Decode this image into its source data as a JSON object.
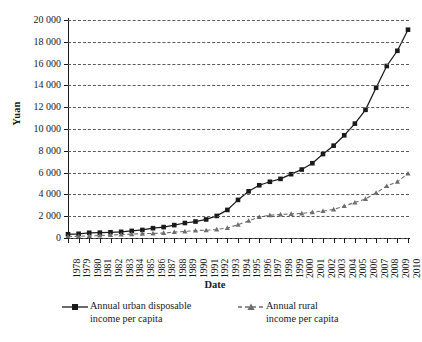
{
  "chart_data": {
    "type": "line",
    "title": "",
    "xlabel": "Date",
    "ylabel": "Yuan",
    "ylim": [
      0,
      20000
    ],
    "ytick_step": 2000,
    "ytick_labels": [
      "0",
      "2 000",
      "4 000",
      "6 000",
      "8 000",
      "10 000",
      "12 000",
      "14 000",
      "16 000",
      "18 000",
      "20 000"
    ],
    "ytick_values": [
      0,
      2000,
      4000,
      6000,
      8000,
      10000,
      12000,
      14000,
      16000,
      18000,
      20000
    ],
    "grid": true,
    "grid_style": "dashed-horizontal",
    "legend_position": "bottom",
    "categories": [
      "1978",
      "1979",
      "1980",
      "1981",
      "1982",
      "1983",
      "1984",
      "1985",
      "1986",
      "1987",
      "1988",
      "1989",
      "1990",
      "1991",
      "1992",
      "1993",
      "1994",
      "1995",
      "1996",
      "1997",
      "1998",
      "1999",
      "2000",
      "2001",
      "2002",
      "2003",
      "2004",
      "2005",
      "2006",
      "2007",
      "2008",
      "2009",
      "2010"
    ],
    "series": [
      {
        "name": "Annual urban disposable income per capita",
        "marker": "square",
        "line_style": "solid",
        "color": "#1a1a1a",
        "values": [
          343,
          387,
          478,
          492,
          527,
          565,
          652,
          739,
          900,
          1002,
          1181,
          1376,
          1510,
          1701,
          2027,
          2577,
          3496,
          4283,
          4839,
          5160,
          5425,
          5854,
          6280,
          6860,
          7703,
          8472,
          9422,
          10493,
          11760,
          13786,
          15781,
          17175,
          19109
        ]
      },
      {
        "name": "Annual rural income per capita",
        "marker": "triangle",
        "line_style": "dashed",
        "color": "#6e6e6e",
        "values": [
          134,
          160,
          191,
          223,
          270,
          310,
          355,
          398,
          424,
          463,
          545,
          602,
          686,
          709,
          784,
          922,
          1221,
          1578,
          1926,
          2090,
          2162,
          2210,
          2253,
          2366,
          2476,
          2622,
          2936,
          3255,
          3587,
          4140,
          4761,
          5153,
          5919
        ]
      }
    ]
  },
  "legend": {
    "entries": [
      {
        "label": "Annual urban disposable\nincome per capita"
      },
      {
        "label": "Annual rural\nincome per capita"
      }
    ]
  }
}
